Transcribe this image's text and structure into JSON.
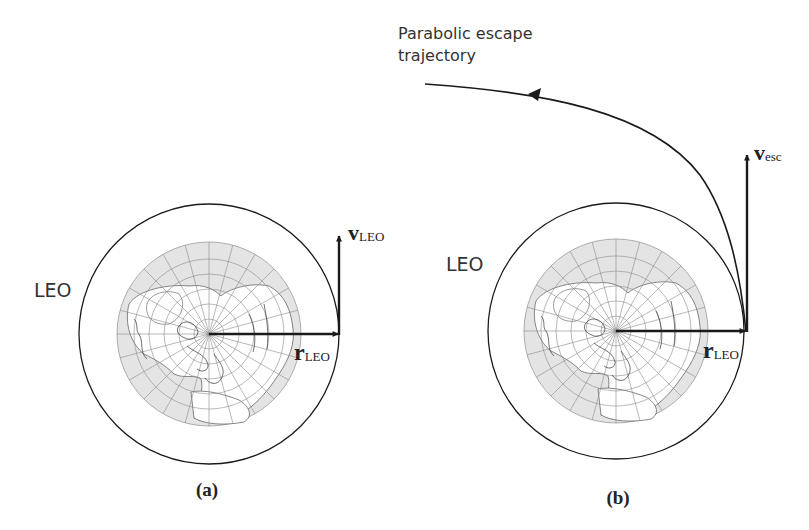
{
  "figure": {
    "panels": [
      {
        "id": "a",
        "caption": "(a)",
        "orbit_label": "LEO",
        "position_vector": {
          "symbol": "r",
          "subscript": "LEO"
        },
        "velocity_vector": {
          "symbol": "v",
          "subscript": "LEO"
        }
      },
      {
        "id": "b",
        "caption": "(b)",
        "orbit_label": "LEO",
        "trajectory_label_line1": "Parabolic escape",
        "trajectory_label_line2": "trajectory",
        "position_vector": {
          "symbol": "r",
          "subscript": "LEO"
        },
        "velocity_vector": {
          "symbol": "v",
          "subscript": "esc"
        }
      }
    ],
    "colors": {
      "line": "#1a1a1a",
      "earth_ocean": "#e4e4e4",
      "earth_land": "#ffffff",
      "grid": "#8a8a8a"
    }
  }
}
